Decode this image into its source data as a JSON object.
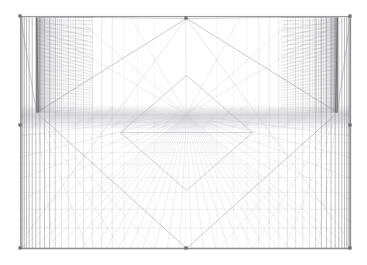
{
  "app": {
    "title": "3D Perspective Wireframe Viewport",
    "background_color": "#ffffff"
  },
  "viewport": {
    "name": "perspective-wireframe-view",
    "width": 367,
    "height": 265,
    "frame": {
      "left": 20,
      "top": 16,
      "right": 350,
      "bottom": 248,
      "stroke": "#9a9a9a",
      "stroke_width": 1.1,
      "corner_node_color": "#6e6e6e",
      "corner_node_size": 3.2,
      "corner_nodes": [
        {
          "name": "corner-handle-top-left",
          "x": 20,
          "y": 16
        },
        {
          "name": "corner-handle-top-right",
          "x": 350,
          "y": 16
        },
        {
          "name": "corner-handle-bottom-left",
          "x": 20,
          "y": 248
        },
        {
          "name": "corner-handle-bottom-right",
          "x": 350,
          "y": 248
        },
        {
          "name": "edge-handle-left-mid",
          "x": 20,
          "y": 125
        },
        {
          "name": "edge-handle-right-mid",
          "x": 350,
          "y": 125
        },
        {
          "name": "apex-handle-top-center",
          "x": 186,
          "y": 18
        },
        {
          "name": "apex-handle-bottom-center",
          "x": 186,
          "y": 248
        }
      ]
    },
    "camera": {
      "vanishing_point": {
        "x": 186,
        "y": 114
      },
      "horizon_y": 114,
      "left_corner": {
        "x": 36,
        "y": 112
      },
      "right_corner": {
        "x": 337,
        "y": 112
      }
    },
    "colors": {
      "grid_light": "#d2d2d6",
      "grid_mid": "#b4b4ba",
      "grid_dark": "#8c8c92",
      "grid_darkest": "#6a6a70",
      "floor_grid": "#dcdce0",
      "haze": "#c8c8cc"
    },
    "geometry": {
      "vertical_line_count": 46,
      "floor_depth_lines": 13,
      "floor_radial_lines": 27,
      "dense_cluster_lines": 34,
      "ceiling_depth_lines": 6
    }
  },
  "chart_data": {
    "type": "scatter",
    "xlabel": "",
    "ylabel": ""
  }
}
